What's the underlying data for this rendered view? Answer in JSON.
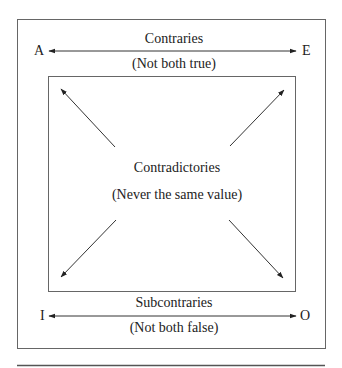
{
  "diagram": {
    "type": "square-of-opposition",
    "corners": {
      "top_left": "A",
      "top_right": "E",
      "bottom_left": "I",
      "bottom_right": "O"
    },
    "top_relation": {
      "label": "Contraries",
      "sublabel": "(Not both true)"
    },
    "center_relation": {
      "label": "Contradictories",
      "sublabel": "(Never the same value)"
    },
    "bottom_relation": {
      "label": "Subcontraries",
      "sublabel": "(Not both false)"
    },
    "edges": [
      {
        "from": "A",
        "to": "E",
        "style": "double-arrow",
        "relation": "Contraries"
      },
      {
        "from": "I",
        "to": "O",
        "style": "double-arrow",
        "relation": "Subcontraries"
      },
      {
        "from": "A",
        "to": "O",
        "style": "double-arrow-diagonal",
        "relation": "Contradictories"
      },
      {
        "from": "E",
        "to": "I",
        "style": "double-arrow-diagonal",
        "relation": "Contradictories"
      }
    ],
    "colors": {
      "line": "#333333",
      "text": "#222222",
      "box": "#555555"
    }
  }
}
